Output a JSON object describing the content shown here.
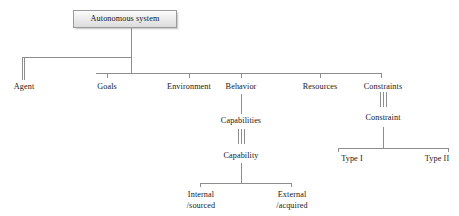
{
  "diagram": {
    "title": "Autonomous system",
    "root": {
      "label": "Autonomous system"
    },
    "level1": {
      "agent": "Agent",
      "goals": "Goals",
      "environment": "Environment",
      "behavior": "Behavior",
      "resources": "Resources",
      "constraints": "Constraints"
    },
    "behavior_branch": {
      "capabilities": "Capabilities",
      "capability": "Capability",
      "internal_line1": "Internal",
      "internal_line2": "/sourced",
      "external_line1": "External",
      "external_line2": "/acquired"
    },
    "constraints_branch": {
      "constraint": "Constraint",
      "type_i": "Type I",
      "type_ii": "Type II"
    },
    "colors": {
      "background": "#ffffff",
      "line": "#8d8d8d",
      "box_border": "#9a9a9a",
      "box_fill_top": "#fdfdfd",
      "box_fill_bottom": "#dcdcdc",
      "text": "#171717"
    }
  }
}
